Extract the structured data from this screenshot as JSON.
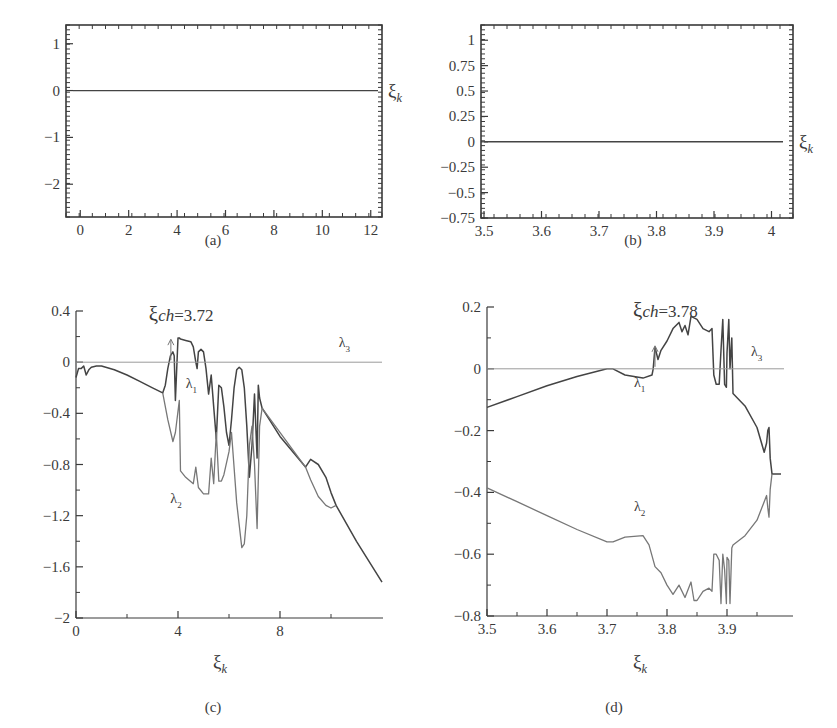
{
  "figure": {
    "panels": [
      "(a)",
      "(b)",
      "(c)",
      "(d)"
    ]
  },
  "colors": {
    "axis": "#3a3a3a",
    "curve_dark": "#444444",
    "curve_light": "#777777",
    "zero_line": "#9a9a9a",
    "background": "#ffffff"
  },
  "chart_data": [
    {
      "panel": "(a)",
      "type": "line",
      "caption": "(a)",
      "title": "",
      "xlabel": "",
      "right_label": "ξk",
      "xlim": [
        -0.3,
        12.3
      ],
      "ylim": [
        -2.7,
        1.4
      ],
      "xticks": [
        0,
        2,
        4,
        6,
        8,
        10,
        12
      ],
      "xtick_labels": [
        "0",
        "2",
        "4",
        "6",
        "8",
        "10",
        "12"
      ],
      "yticks": [
        1,
        0,
        -1,
        -2
      ],
      "ytick_labels": [
        "1",
        "0",
        "−1",
        "−2"
      ],
      "series": [
        {
          "name": "ξk",
          "x": [
            -0.3,
            12.3
          ],
          "y": [
            0,
            0
          ]
        }
      ],
      "grid": false,
      "frame": "box"
    },
    {
      "panel": "(b)",
      "type": "line",
      "caption": "(b)",
      "title": "",
      "xlabel": "",
      "right_label": "ξk",
      "xlim": [
        3.5,
        4.02
      ],
      "ylim": [
        -0.75,
        1.15
      ],
      "xticks": [
        3.5,
        3.6,
        3.7,
        3.8,
        3.9,
        4.0
      ],
      "xtick_labels": [
        "3.5",
        "3.6",
        "3.7",
        "3.8",
        "3.9",
        "4"
      ],
      "yticks": [
        1,
        0.75,
        0.5,
        0.25,
        0,
        -0.25,
        -0.5,
        -0.75
      ],
      "ytick_labels": [
        "1",
        "0.75",
        "0.5",
        "0.25",
        "0",
        "−0.25",
        "−0.5",
        "−0.75"
      ],
      "series": [
        {
          "name": "ξk",
          "x": [
            3.5,
            4.02
          ],
          "y": [
            0,
            0
          ]
        }
      ],
      "grid": false,
      "frame": "box"
    },
    {
      "panel": "(c)",
      "type": "line",
      "caption": "(c)",
      "title": "",
      "xlabel": "ξk",
      "ylabel": "",
      "xlim": [
        0,
        12
      ],
      "ylim": [
        -2,
        0.4
      ],
      "xticks": [
        0,
        4,
        8
      ],
      "xtick_labels": [
        "0",
        "4",
        "8"
      ],
      "yticks": [
        0.4,
        0,
        -0.4,
        -0.8,
        -1.2,
        -1.6,
        -2
      ],
      "ytick_labels": [
        "0.4",
        "0",
        "−0.4",
        "−0.8",
        "−1.2",
        "−1.6",
        "−2"
      ],
      "annotations": [
        {
          "text": "ξch=3.72",
          "x": 3.72,
          "y": 0.3,
          "arrow": true
        },
        {
          "text": "λ1",
          "x": 4.3,
          "y": -0.2
        },
        {
          "text": "λ2",
          "x": 3.7,
          "y": -1.1
        },
        {
          "text": "λ3",
          "x": 10.3,
          "y": 0.12
        }
      ],
      "series": [
        {
          "name": "λ1",
          "x": [
            0,
            0.1,
            0.2,
            0.3,
            0.4,
            0.5,
            0.6,
            0.8,
            1.0,
            1.5,
            2.0,
            2.5,
            3.0,
            3.4,
            3.5,
            3.6,
            3.7,
            3.8,
            3.85,
            3.9,
            4.0,
            4.05,
            4.1,
            4.3,
            4.5,
            4.6,
            4.7,
            4.75,
            4.8,
            4.9,
            5.0,
            5.1,
            5.2,
            5.3,
            5.4,
            5.5,
            5.6,
            5.7,
            5.8,
            5.9,
            6.0,
            6.1,
            6.2,
            6.3,
            6.4,
            6.5,
            6.6,
            6.7,
            6.8,
            6.9,
            7.0,
            7.1,
            7.15,
            7.2,
            7.3,
            8.0,
            9.0,
            9.2,
            9.5,
            9.8,
            10.0,
            10.2,
            11.0,
            12.0
          ],
          "y": [
            -0.12,
            -0.05,
            -0.05,
            -0.03,
            -0.1,
            -0.06,
            -0.04,
            -0.03,
            -0.03,
            -0.06,
            -0.1,
            -0.15,
            -0.2,
            -0.24,
            -0.18,
            -0.05,
            0.05,
            0.08,
            0.05,
            -0.3,
            0.19,
            0.19,
            0.18,
            0.17,
            0.16,
            0.12,
            0.0,
            -0.05,
            0.08,
            0.1,
            0.08,
            -0.05,
            -0.25,
            -0.1,
            -0.35,
            -0.6,
            -0.18,
            -0.2,
            -0.35,
            -0.55,
            -0.65,
            -0.45,
            -0.2,
            -0.06,
            -0.04,
            -0.06,
            -0.2,
            -0.5,
            -0.9,
            -0.65,
            -0.25,
            -0.75,
            -0.18,
            -0.28,
            -0.36,
            -0.58,
            -0.82,
            -0.76,
            -0.8,
            -0.9,
            -1.02,
            -1.12,
            -1.4,
            -1.72
          ]
        },
        {
          "name": "λ2",
          "x": [
            3.4,
            3.6,
            3.8,
            3.9,
            4.05,
            4.1,
            4.3,
            4.6,
            4.7,
            4.8,
            5.0,
            5.2,
            5.3,
            5.4,
            5.5,
            5.6,
            5.7,
            5.8,
            6.0,
            6.1,
            6.3,
            6.5,
            6.6,
            6.7,
            6.8,
            6.9,
            7.0,
            7.1,
            7.2,
            7.3,
            9.0,
            9.2,
            9.5,
            9.8,
            10.0,
            10.2
          ],
          "y": [
            -0.24,
            -0.45,
            -0.62,
            -0.55,
            -0.3,
            -0.85,
            -0.9,
            -0.95,
            -0.82,
            -0.98,
            -1.03,
            -1.03,
            -0.75,
            -0.95,
            -0.55,
            -0.93,
            -0.93,
            -0.88,
            -0.7,
            -0.55,
            -1.1,
            -1.45,
            -1.42,
            -1.2,
            -0.65,
            -0.5,
            -0.8,
            -1.3,
            -0.5,
            -0.36,
            -0.82,
            -0.92,
            -1.05,
            -1.12,
            -1.14,
            -1.12
          ]
        },
        {
          "name": "λ3",
          "x": [
            0,
            12
          ],
          "y": [
            0,
            0
          ]
        }
      ],
      "grid": false,
      "frame": "left-bottom"
    },
    {
      "panel": "(d)",
      "type": "line",
      "caption": "(d)",
      "title": "",
      "xlabel": "ξk",
      "ylabel": "",
      "xlim": [
        3.5,
        4.0
      ],
      "ylim": [
        -0.8,
        0.2
      ],
      "xticks": [
        3.5,
        3.6,
        3.7,
        3.8,
        3.9
      ],
      "xtick_labels": [
        "3.5",
        "3.6",
        "3.7",
        "3.8",
        "3.9"
      ],
      "yticks": [
        0.2,
        0,
        -0.2,
        -0.4,
        -0.6,
        -0.8
      ],
      "ytick_labels": [
        "0.2",
        "0",
        "−0.2",
        "−0.4",
        "−0.6",
        "−0.8"
      ],
      "annotations": [
        {
          "text": "ξch=3.78",
          "x": 3.78,
          "y": 0.14,
          "arrow": true
        },
        {
          "text": "λ1",
          "x": 3.745,
          "y": -0.06
        },
        {
          "text": "λ2",
          "x": 3.745,
          "y": -0.46
        },
        {
          "text": "λ3",
          "x": 3.94,
          "y": 0.04
        }
      ],
      "series": [
        {
          "name": "λ1",
          "x": [
            3.5,
            3.55,
            3.6,
            3.65,
            3.7,
            3.71,
            3.73,
            3.76,
            3.775,
            3.777,
            3.78,
            3.785,
            3.79,
            3.8,
            3.81,
            3.82,
            3.825,
            3.83,
            3.835,
            3.84,
            3.85,
            3.86,
            3.87,
            3.875,
            3.878,
            3.882,
            3.887,
            3.89,
            3.893,
            3.896,
            3.899,
            3.9,
            3.903,
            3.905,
            3.908,
            3.91,
            3.93,
            3.95,
            3.962,
            3.966,
            3.968,
            3.97,
            3.972,
            3.975,
            3.98,
            3.99
          ],
          "y": [
            -0.125,
            -0.09,
            -0.055,
            -0.025,
            0.0,
            0.0,
            -0.02,
            -0.03,
            -0.02,
            0.0,
            0.07,
            0.03,
            0.06,
            0.09,
            0.13,
            0.15,
            0.12,
            0.14,
            0.11,
            0.17,
            0.16,
            0.13,
            0.12,
            0.13,
            -0.02,
            -0.05,
            -0.05,
            0.06,
            0.16,
            -0.05,
            -0.06,
            0.05,
            0.16,
            0.0,
            0.1,
            -0.08,
            -0.12,
            -0.19,
            -0.27,
            -0.24,
            -0.2,
            -0.19,
            -0.29,
            -0.34,
            -0.34,
            -0.34
          ]
        },
        {
          "name": "λ2",
          "x": [
            3.5,
            3.55,
            3.6,
            3.65,
            3.7,
            3.71,
            3.73,
            3.76,
            3.77,
            3.78,
            3.79,
            3.8,
            3.81,
            3.82,
            3.83,
            3.84,
            3.845,
            3.85,
            3.86,
            3.87,
            3.875,
            3.878,
            3.882,
            3.887,
            3.89,
            3.893,
            3.896,
            3.899,
            3.9,
            3.903,
            3.905,
            3.908,
            3.91,
            3.93,
            3.95,
            3.962,
            3.966,
            3.968,
            3.97,
            3.972,
            3.975
          ],
          "y": [
            -0.385,
            -0.43,
            -0.475,
            -0.52,
            -0.56,
            -0.56,
            -0.545,
            -0.54,
            -0.57,
            -0.64,
            -0.66,
            -0.7,
            -0.73,
            -0.7,
            -0.74,
            -0.69,
            -0.75,
            -0.75,
            -0.72,
            -0.71,
            -0.72,
            -0.6,
            -0.6,
            -0.62,
            -0.76,
            -0.6,
            -0.65,
            -0.76,
            -0.61,
            -0.62,
            -0.76,
            -0.58,
            -0.57,
            -0.54,
            -0.49,
            -0.43,
            -0.41,
            -0.45,
            -0.48,
            -0.39,
            -0.34
          ]
        },
        {
          "name": "λ3",
          "x": [
            3.5,
            3.995
          ],
          "y": [
            0,
            0
          ]
        }
      ],
      "grid": false,
      "frame": "left-bottom"
    }
  ]
}
